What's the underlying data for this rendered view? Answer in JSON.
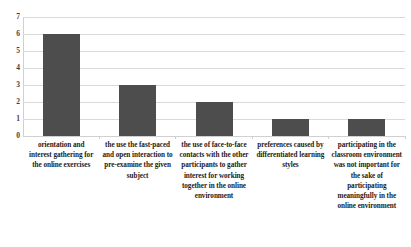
{
  "chart_data": {
    "type": "bar",
    "title": "",
    "xlabel": "",
    "ylabel": "",
    "ylim": [
      0,
      7
    ],
    "yticks": [
      "0",
      "1",
      "2",
      "3",
      "4",
      "5",
      "6",
      "7"
    ],
    "grid": true,
    "legend": "none",
    "bar_color": "#4d4d4d",
    "gridline_color": "#d9d9d9",
    "axis_color": "#d0d0d0",
    "categories": [
      "orientation and interest gathering for the online exercises",
      "the use the fast-paced and open interaction to pre-examine the given subject",
      "the use of face-to-face contacts with the other participants to gather interest for working together in the online environment",
      "preferences caused by differentiated learning styles",
      "participating in the classroom environment was not important for the sake of participating meaningfully in the online environment"
    ],
    "values": [
      6,
      3,
      2,
      1,
      1
    ]
  }
}
